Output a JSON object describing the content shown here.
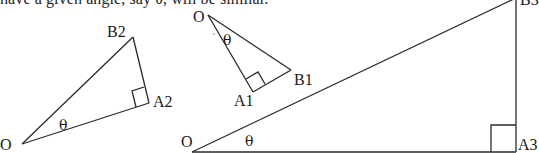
{
  "caption": {
    "top_text": "have a given angle, say θ, will be similar."
  },
  "angle_symbol": "θ",
  "triangles": [
    {
      "id": "triangle-2",
      "vertices": {
        "origin": "O",
        "right_angle": "A2",
        "apex": "B2"
      },
      "angle_label": "θ"
    },
    {
      "id": "triangle-1",
      "vertices": {
        "origin": "O",
        "right_angle": "A1",
        "apex": "B1"
      },
      "angle_label": "θ"
    },
    {
      "id": "triangle-3",
      "vertices": {
        "origin": "O",
        "right_angle": "A3",
        "apex": "B3"
      },
      "angle_label": "θ"
    }
  ],
  "colors": {
    "line": "#2a2a2a",
    "text": "#1a1a1a",
    "background": "#ffffff"
  }
}
